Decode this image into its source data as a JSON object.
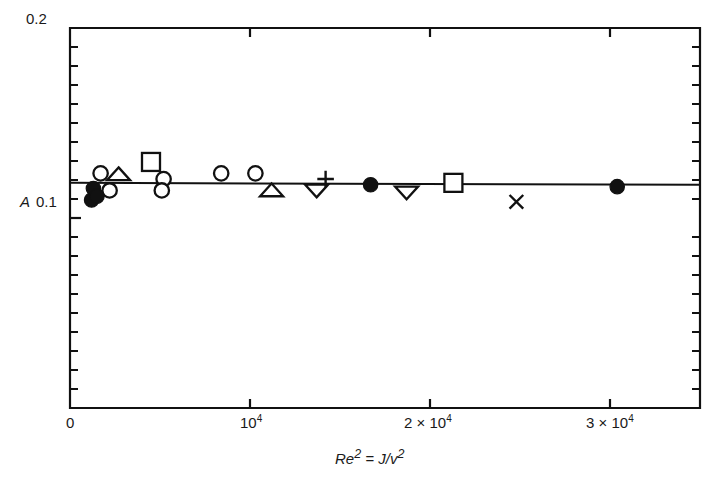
{
  "figure": {
    "background": "#ffffff",
    "line_color": "#111111",
    "marker_color": "#111111"
  },
  "axes": {
    "y_title": "A",
    "x_title_html": "Re² = J/v²",
    "x_title_parts": {
      "re": "Re",
      "re_exp": "2",
      "eq": " = ",
      "j": "J",
      "slash": "/",
      "nu": "v",
      "nu_exp": "2"
    },
    "y_ticks_labeled": [
      {
        "value": 0.2,
        "label": "0.2"
      },
      {
        "value": 0.1,
        "label": "0.1"
      }
    ],
    "y_minor_tick_values": [
      0.19,
      0.18,
      0.17,
      0.16,
      0.15,
      0.14,
      0.13,
      0.12,
      0.11,
      0.09,
      0.08,
      0.07,
      0.06,
      0.05,
      0.04,
      0.03,
      0.02,
      0.01
    ],
    "x_ticks_labeled": [
      {
        "value": 0,
        "label": "0",
        "mantissa": "",
        "exponent": ""
      },
      {
        "value": 10000,
        "label": "10⁴",
        "mantissa": "10",
        "exponent": "4"
      },
      {
        "value": 20000,
        "label": "2 × 10⁴",
        "mantissa": "2 × 10",
        "exponent": "4"
      },
      {
        "value": 30000,
        "label": "3 × 10⁴",
        "mantissa": "3 × 10",
        "exponent": "4"
      }
    ]
  },
  "chart_data": {
    "type": "scatter",
    "title": "",
    "subtitle": "",
    "xlabel": "Re² = J/v²",
    "ylabel": "A",
    "xlim": [
      0,
      35000
    ],
    "ylim": [
      0,
      0.2
    ],
    "grid": false,
    "legend": null,
    "legend_position": "none",
    "annotations": [],
    "fit_line": {
      "name": "horizontal fit line",
      "type": "line",
      "x": [
        0,
        35000
      ],
      "y": [
        0.1185,
        0.1175
      ]
    },
    "series": [
      {
        "name": "open circle",
        "marker": "circle-open",
        "points": [
          {
            "x": 1700,
            "y": 0.1235
          },
          {
            "x": 2200,
            "y": 0.1145
          },
          {
            "x": 5200,
            "y": 0.1205
          },
          {
            "x": 5100,
            "y": 0.1145
          },
          {
            "x": 8400,
            "y": 0.1235
          },
          {
            "x": 10300,
            "y": 0.1235
          }
        ]
      },
      {
        "name": "filled circle",
        "marker": "circle-filled",
        "points": [
          {
            "x": 1300,
            "y": 0.1155
          },
          {
            "x": 1200,
            "y": 0.1095
          },
          {
            "x": 1500,
            "y": 0.1115
          },
          {
            "x": 16700,
            "y": 0.1175
          },
          {
            "x": 30400,
            "y": 0.1165
          }
        ]
      },
      {
        "name": "open triangle up",
        "marker": "triangle-up-open",
        "points": [
          {
            "x": 2700,
            "y": 0.123
          },
          {
            "x": 11200,
            "y": 0.1145
          }
        ]
      },
      {
        "name": "open triangle down",
        "marker": "triangle-down-open",
        "points": [
          {
            "x": 13700,
            "y": 0.1145
          },
          {
            "x": 18700,
            "y": 0.1135
          }
        ]
      },
      {
        "name": "open square",
        "marker": "square-open",
        "points": [
          {
            "x": 4500,
            "y": 0.1295
          },
          {
            "x": 21300,
            "y": 0.1185
          }
        ]
      },
      {
        "name": "plus",
        "marker": "plus",
        "points": [
          {
            "x": 14200,
            "y": 0.1205
          }
        ]
      },
      {
        "name": "cross",
        "marker": "cross",
        "points": [
          {
            "x": 24800,
            "y": 0.1085
          }
        ]
      }
    ]
  }
}
